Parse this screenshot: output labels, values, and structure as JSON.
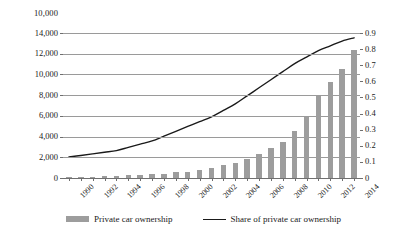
{
  "chart_data": {
    "type": "bar",
    "title": "",
    "subtitle": "",
    "xlabel": "",
    "ylabel": "",
    "categories": [
      "1990",
      "1991",
      "1992",
      "1993",
      "1994",
      "1995",
      "1996",
      "1997",
      "1998",
      "1999",
      "2000",
      "2001",
      "2002",
      "2003",
      "2004",
      "2005",
      "2006",
      "2007",
      "2008",
      "2009",
      "2010",
      "2011",
      "2012",
      "2013",
      "2014"
    ],
    "xtick_labels": [
      "1990",
      "1992",
      "1994",
      "1996",
      "1998",
      "2000",
      "2002",
      "2004",
      "2006",
      "2008",
      "2010",
      "2012",
      "2014"
    ],
    "grid": true,
    "legend_position": "bottom",
    "series": [
      {
        "name": "Private car ownership",
        "type": "bar",
        "axis": "left",
        "color": "#9d9d9d",
        "values": [
          82,
          96,
          118,
          156,
          205,
          250,
          290,
          358,
          423,
          534,
          625,
          771,
          969,
          1219,
          1481,
          1848,
          2333,
          2876,
          3501,
          4575,
          5939,
          7872,
          9309,
          10502,
          12339
        ]
      },
      {
        "name": "Share of private car ownership",
        "type": "line",
        "axis": "right",
        "color": "#1a1a1a",
        "values": [
          0.13,
          0.14,
          0.15,
          0.16,
          0.17,
          0.19,
          0.21,
          0.23,
          0.26,
          0.29,
          0.32,
          0.35,
          0.38,
          0.42,
          0.46,
          0.51,
          0.56,
          0.61,
          0.66,
          0.71,
          0.75,
          0.79,
          0.82,
          0.85,
          0.87
        ]
      }
    ],
    "left_axis": {
      "min": 0,
      "max": 14000,
      "step": 2000,
      "tick_labels": [
        "14,000",
        "12,000",
        "10,000",
        "8,000",
        "6,000",
        "4,000",
        "2,000",
        "0"
      ],
      "tick_values": [
        14000,
        12000,
        10000,
        8000,
        6000,
        4000,
        2000,
        0
      ]
    },
    "right_axis": {
      "min": 0,
      "max": 0.9,
      "step": 0.1,
      "tick_labels": [
        "0.9",
        "0.8",
        "0.7",
        "0.6",
        "0.5",
        "0.4",
        "0.3",
        "0.2",
        "0.1",
        "0"
      ],
      "tick_values": [
        0.9,
        0.8,
        0.7,
        0.6,
        0.5,
        0.4,
        0.3,
        0.2,
        0.1,
        0
      ]
    },
    "stray_top_label": "10,000"
  },
  "legend": {
    "bar_label": "Private car ownership",
    "line_label": "Share of private car ownership"
  },
  "colors": {
    "bar": "#9d9d9d",
    "line": "#1a1a1a",
    "grid": "#9a9a9a",
    "axis": "#6f6f6f",
    "background": "#ffffff"
  }
}
